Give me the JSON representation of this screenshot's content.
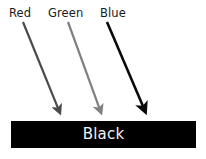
{
  "figure": {
    "background_color": "#ffffff",
    "width": 206,
    "height": 159
  },
  "arrows": [
    {
      "label": "Red",
      "icon": "arrow-down-right-icon",
      "color": "#4a4a4a",
      "x1": 23,
      "y1": 22,
      "x2": 62,
      "y2": 118,
      "stroke_width": 2.2
    },
    {
      "label": "Green",
      "icon": "arrow-down-right-icon",
      "color": "#808080",
      "x1": 68,
      "y1": 22,
      "x2": 103,
      "y2": 118,
      "stroke_width": 2.2
    },
    {
      "label": "Blue",
      "icon": "arrow-down-right-icon",
      "color": "#0a0a0a",
      "x1": 107,
      "y1": 22,
      "x2": 148,
      "y2": 118,
      "stroke_width": 2.6
    }
  ],
  "result": {
    "label": "Black",
    "fill_color": "#000000",
    "text_color": "#f2f2f2"
  }
}
